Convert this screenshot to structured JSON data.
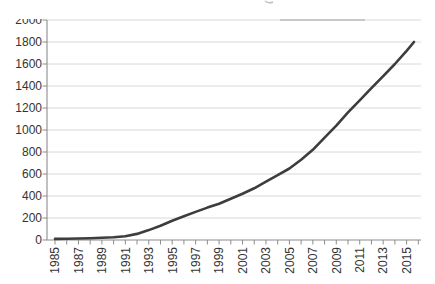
{
  "page": {
    "background": "#ffffff",
    "title": ""
  },
  "chart_data": {
    "type": "line",
    "title": "",
    "xlabel": "",
    "ylabel": "",
    "x": [
      1985,
      1986,
      1987,
      1988,
      1989,
      1990,
      1991,
      1992,
      1993,
      1994,
      1995,
      1996,
      1997,
      1998,
      1999,
      2000,
      2001,
      2002,
      2003,
      2004,
      2005,
      2006,
      2007,
      2008,
      2009,
      2010,
      2011,
      2012,
      2013,
      2014,
      2015,
      2016
    ],
    "series": [
      {
        "name": "series-1",
        "values": [
          10,
          12,
          14,
          16,
          20,
          25,
          35,
          55,
          90,
          130,
          175,
          215,
          255,
          295,
          330,
          375,
          420,
          470,
          530,
          590,
          650,
          730,
          820,
          930,
          1040,
          1160,
          1270,
          1380,
          1490,
          1600,
          1720,
          1800
        ]
      }
    ],
    "x_tick_labels": [
      "1985",
      "1987",
      "1989",
      "1991",
      "1993",
      "1995",
      "1997",
      "1999",
      "2001",
      "2003",
      "2005",
      "2007",
      "2009",
      "2011",
      "2013",
      "2015"
    ],
    "x_minor_ticks_every_year": true,
    "x_label_rotation_deg": -90,
    "y_ticks": [
      0,
      200,
      400,
      600,
      800,
      1000,
      1200,
      1400,
      1600,
      1800,
      2000
    ],
    "ylim": [
      0,
      2000
    ],
    "grid": "horizontal",
    "legend": "none",
    "notes": {
      "top_y_label_clipped": "2000 label top edge cut off by image crop",
      "scan_artifacts": "darker smudge on 2000 gridline; tiny gray mark above chart"
    },
    "colors": {
      "line": "#3d3d3d",
      "gridline": "#d8d8d8",
      "axis": "#8c8c8c",
      "tick": "#8c8c8c",
      "label": "#333333",
      "artifact": "#b0b0b0",
      "background": "#ffffff"
    }
  }
}
